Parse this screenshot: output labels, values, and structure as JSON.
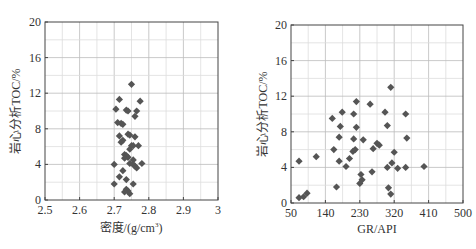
{
  "chart_data": [
    {
      "type": "scatter",
      "title": "",
      "xlabel": "密度/(g/cm³)",
      "xlabel_main": "密度/(g/cm",
      "xlabel_sup": "3",
      "xlabel_end": ")",
      "ylabel": "岩心分析TOC/%",
      "xlim": [
        2.5,
        3.0
      ],
      "ylim": [
        0,
        20
      ],
      "xticks": [
        "2.5",
        "2.6",
        "2.7",
        "2.8",
        "2.9",
        "3"
      ],
      "yticks": [
        "0",
        "4",
        "8",
        "12",
        "16",
        "20"
      ],
      "grid": true,
      "marker": "diamond",
      "marker_color": "#555555",
      "points": [
        [
          2.75,
          13.0
        ],
        [
          2.715,
          11.3
        ],
        [
          2.775,
          11.1
        ],
        [
          2.705,
          10.2
        ],
        [
          2.735,
          10.1
        ],
        [
          2.74,
          10.0
        ],
        [
          2.765,
          10.0
        ],
        [
          2.76,
          9.4
        ],
        [
          2.71,
          8.7
        ],
        [
          2.72,
          8.6
        ],
        [
          2.725,
          8.5
        ],
        [
          2.74,
          7.4
        ],
        [
          2.745,
          7.3
        ],
        [
          2.76,
          7.1
        ],
        [
          2.715,
          7.2
        ],
        [
          2.725,
          6.7
        ],
        [
          2.72,
          6.5
        ],
        [
          2.75,
          6.1
        ],
        [
          2.755,
          6.1
        ],
        [
          2.77,
          6.1
        ],
        [
          2.745,
          5.7
        ],
        [
          2.73,
          5.1
        ],
        [
          2.735,
          5.0
        ],
        [
          2.74,
          4.8
        ],
        [
          2.73,
          4.7
        ],
        [
          2.755,
          4.5
        ],
        [
          2.7,
          4.0
        ],
        [
          2.745,
          4.1
        ],
        [
          2.755,
          4.0
        ],
        [
          2.76,
          3.8
        ],
        [
          2.765,
          3.6
        ],
        [
          2.78,
          4.1
        ],
        [
          2.725,
          3.3
        ],
        [
          2.715,
          2.6
        ],
        [
          2.735,
          2.3
        ],
        [
          2.7,
          1.8
        ],
        [
          2.755,
          1.8
        ],
        [
          2.735,
          1.2
        ],
        [
          2.74,
          1.0
        ],
        [
          2.73,
          0.9
        ],
        [
          2.745,
          0.7
        ]
      ]
    },
    {
      "type": "scatter",
      "title": "",
      "xlabel": "GR/API",
      "ylabel": "岩心分析TOC/%",
      "xlim": [
        50,
        500
      ],
      "ylim": [
        0,
        20
      ],
      "xticks": [
        "50",
        "140",
        "230",
        "320",
        "410",
        "500"
      ],
      "yticks": [
        "0",
        "4",
        "8",
        "12",
        "16",
        "20"
      ],
      "grid": true,
      "marker": "diamond",
      "marker_color": "#555555",
      "points": [
        [
          71,
          4.7
        ],
        [
          71,
          0.6
        ],
        [
          83,
          0.7
        ],
        [
          92,
          1.1
        ],
        [
          116,
          5.2
        ],
        [
          158,
          9.5
        ],
        [
          162,
          6.0
        ],
        [
          176,
          7.4
        ],
        [
          179,
          8.6
        ],
        [
          184,
          10.2
        ],
        [
          176,
          4.7
        ],
        [
          169,
          1.8
        ],
        [
          194,
          4.1
        ],
        [
          203,
          5.0
        ],
        [
          212,
          5.8
        ],
        [
          218,
          6.0
        ],
        [
          214,
          7.2
        ],
        [
          214,
          10.0
        ],
        [
          221,
          8.5
        ],
        [
          221,
          11.4
        ],
        [
          230,
          2.2
        ],
        [
          233,
          3.2
        ],
        [
          236,
          2.6
        ],
        [
          239,
          7.1
        ],
        [
          257,
          11.1
        ],
        [
          262,
          3.5
        ],
        [
          265,
          6.1
        ],
        [
          275,
          6.7
        ],
        [
          281,
          6.5
        ],
        [
          296,
          10.2
        ],
        [
          302,
          8.7
        ],
        [
          302,
          4.0
        ],
        [
          305,
          1.7
        ],
        [
          311,
          13.0
        ],
        [
          311,
          1.0
        ],
        [
          314,
          4.5
        ],
        [
          320,
          5.7
        ],
        [
          329,
          3.9
        ],
        [
          350,
          10.0
        ],
        [
          353,
          7.3
        ],
        [
          350,
          4.0
        ],
        [
          398,
          4.1
        ]
      ]
    }
  ]
}
